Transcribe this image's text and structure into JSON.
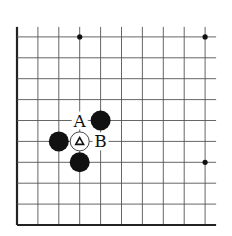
{
  "diagram": {
    "type": "go-board-corner",
    "grid": {
      "columns": 10,
      "rows": 10,
      "origin_x": 17,
      "bottom_y": 225,
      "spacing": 20.9,
      "line_color": "#555555",
      "edge_color": "#222222",
      "open_top": true,
      "open_right": true
    },
    "star_points": [
      {
        "col": 3,
        "row": 9
      },
      {
        "col": 9,
        "row": 9
      },
      {
        "col": 9,
        "row": 3
      }
    ],
    "stones": [
      {
        "color": "black",
        "col": 4,
        "row": 5
      },
      {
        "color": "black",
        "col": 2,
        "row": 4
      },
      {
        "color": "black",
        "col": 3,
        "row": 3
      },
      {
        "color": "white",
        "col": 3,
        "row": 4,
        "marker": "triangle"
      }
    ],
    "labels": [
      {
        "text": "A",
        "col": 3,
        "row": 5
      },
      {
        "text": "B",
        "col": 4,
        "row": 4
      }
    ],
    "colors": {
      "black_stone": "#111111",
      "white_stone": "#ffffff",
      "background": "#ffffff"
    }
  }
}
